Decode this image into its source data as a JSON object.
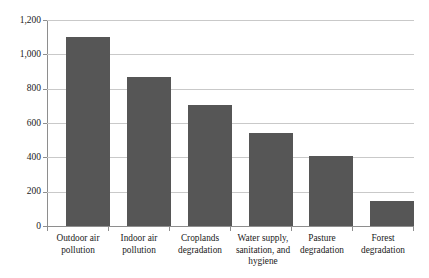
{
  "chart_data": {
    "type": "bar",
    "title": "",
    "xlabel": "",
    "ylabel": "",
    "ylim": [
      0,
      1200
    ],
    "grid": true,
    "legend": "none",
    "categories": [
      "Outdoor air pollution",
      "Indoor air pollution",
      "Croplands degradation",
      "Water supply, sanitation, and hygiene",
      "Pasture degradation",
      "Forest degradation"
    ],
    "category_lines": [
      [
        "Outdoor air",
        "pollution"
      ],
      [
        "Indoor air",
        "pollution"
      ],
      [
        "Croplands",
        "degradation"
      ],
      [
        "Water supply,",
        "sanitation, and",
        "hygiene"
      ],
      [
        "Pasture",
        "degradation"
      ],
      [
        "Forest",
        "degradation"
      ]
    ],
    "values": [
      1100,
      870,
      705,
      540,
      410,
      145
    ],
    "ytick_values": [
      0,
      200,
      400,
      600,
      800,
      1000,
      1200
    ],
    "ytick_labels": [
      "0",
      "200",
      "400",
      "600",
      "800",
      "1,000",
      "1,200"
    ],
    "bar_color": "#565656",
    "gridline_color": "#c9c9c9",
    "axis_color": "#8e8e8e",
    "background_color": "#ffffff"
  }
}
